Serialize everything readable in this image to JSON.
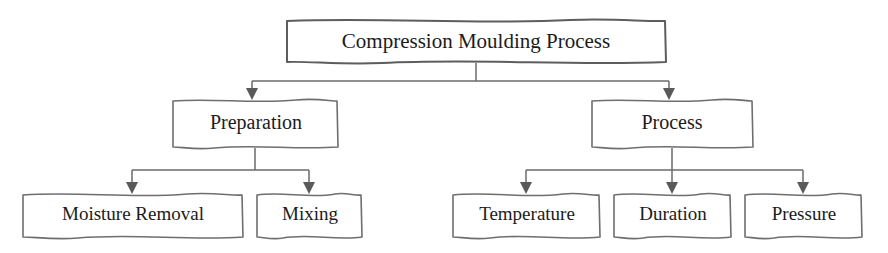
{
  "diagram": {
    "title": "Compression Moulding Process",
    "type": "hierarchy-tree",
    "orientation": "top-down",
    "background_color": "#ffffff",
    "line_color": "#6a6a6a",
    "text_color": "#1b1b1b",
    "box_fill": "#ffffff",
    "levels": 3,
    "nodes": {
      "root": {
        "label": "Compression Moulding Process",
        "level": 1,
        "box": {
          "x": 286,
          "y": 20,
          "w": 380,
          "h": 43
        },
        "center_x": 476
      },
      "preparation": {
        "label": "Preparation",
        "level": 2,
        "box": {
          "x": 172,
          "y": 100,
          "w": 166,
          "h": 48
        },
        "center_x": 255
      },
      "process": {
        "label": "Process",
        "level": 2,
        "box": {
          "x": 591,
          "y": 100,
          "w": 162,
          "h": 48
        },
        "center_x": 672
      },
      "moisture_removal": {
        "label": "Moisture Removal",
        "level": 3,
        "box": {
          "x": 22,
          "y": 194,
          "w": 221,
          "h": 44
        },
        "center_x": 132
      },
      "mixing": {
        "label": "Mixing",
        "level": 3,
        "box": {
          "x": 256,
          "y": 194,
          "w": 106,
          "h": 44
        },
        "center_x": 309
      },
      "temperature": {
        "label": "Temperature",
        "level": 3,
        "box": {
          "x": 452,
          "y": 194,
          "w": 148,
          "h": 44
        },
        "center_x": 526
      },
      "duration": {
        "label": "Duration",
        "level": 3,
        "box": {
          "x": 613,
          "y": 194,
          "w": 118,
          "h": 44
        },
        "center_x": 672
      },
      "pressure": {
        "label": "Pressure",
        "level": 3,
        "box": {
          "x": 744,
          "y": 194,
          "w": 118,
          "h": 44
        },
        "center_x": 803
      }
    },
    "edges": [
      {
        "from": "root",
        "to": "preparation"
      },
      {
        "from": "root",
        "to": "process"
      },
      {
        "from": "preparation",
        "to": "moisture_removal"
      },
      {
        "from": "preparation",
        "to": "mixing"
      },
      {
        "from": "process",
        "to": "temperature"
      },
      {
        "from": "process",
        "to": "duration"
      },
      {
        "from": "process",
        "to": "pressure"
      }
    ]
  }
}
